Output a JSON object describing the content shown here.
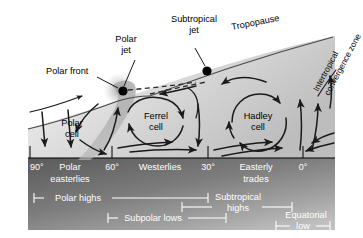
{
  "figure": {
    "width": 363,
    "height": 238
  },
  "colors": {
    "ink": "#000000",
    "arrow": "#1a1a1a",
    "sky_light": "#efefef",
    "sky_mid": "#c9c9c9",
    "ground_dark": "#4d4d4d",
    "ground_light": "#b5b5b5",
    "front_band": "#a8a8a8",
    "white": "#ffffff"
  },
  "callouts": {
    "polar_front": "Polar front",
    "polar_jet_line1": "Polar",
    "polar_jet_line2": "jet",
    "subtropical_jet_line1": "Subtropical",
    "subtropical_jet_line2": "jet",
    "tropopause": "Tropopause",
    "itcz_line1": "Intertropical",
    "itcz_line2": "convergence zone"
  },
  "cells": [
    {
      "name": "polar-cell",
      "line1": "Polar",
      "line2": "cell"
    },
    {
      "name": "ferrel-cell",
      "line1": "Ferrel",
      "line2": "cell"
    },
    {
      "name": "hadley-cell",
      "line1": "Hadley",
      "line2": "cell"
    }
  ],
  "latitude_axis": {
    "ticks": [
      {
        "label": "90°",
        "x": 30
      },
      {
        "label": "60°",
        "x": 112
      },
      {
        "label": "30°",
        "x": 208
      },
      {
        "label": "0°",
        "x": 303
      }
    ]
  },
  "surface_winds": [
    {
      "name": "polar-easterlies",
      "line1": "Polar",
      "line2": "easterlies"
    },
    {
      "name": "westerlies",
      "line1": "Westerlies",
      "line2": ""
    },
    {
      "name": "easterly-trades",
      "line1": "Easterly",
      "line2": "trades"
    }
  ],
  "pressure_belts": [
    {
      "name": "polar-highs",
      "line1": "Polar highs",
      "line2": ""
    },
    {
      "name": "subtropical-highs",
      "line1": "Subtropical",
      "line2": "highs"
    },
    {
      "name": "subpolar-lows",
      "line1": "Subpolar lows",
      "line2": ""
    },
    {
      "name": "equatorial-low",
      "line1": "Equatorial",
      "line2": "low"
    }
  ]
}
